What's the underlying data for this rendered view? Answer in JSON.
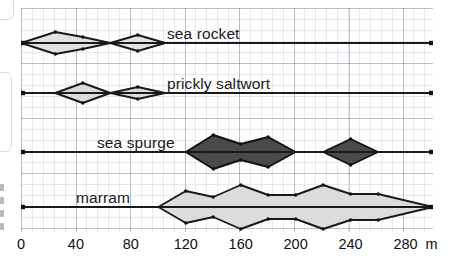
{
  "chart_data": {
    "type": "area",
    "chart_kind": "kite-diagram",
    "title": "",
    "xlabel": "m",
    "ylabel": "",
    "xlim": [
      0,
      300
    ],
    "grid": true,
    "legend": "inline-labels",
    "axis_unit": "m",
    "x_ticks": [
      {
        "value": 0,
        "label": "0"
      },
      {
        "value": 40,
        "label": "40"
      },
      {
        "value": 80,
        "label": "80"
      },
      {
        "value": 120,
        "label": "120"
      },
      {
        "value": 160,
        "label": "160"
      },
      {
        "value": 200,
        "label": "200"
      },
      {
        "value": 240,
        "label": "240"
      },
      {
        "value": 280,
        "label": "280"
      }
    ],
    "series": [
      {
        "name": "sea rocket",
        "label": "sea rocket",
        "fill": "#e2e2e2",
        "stroke": "#1a1a1a",
        "baseline_y": 43,
        "x": [
          0,
          25,
          45,
          65,
          85,
          105,
          300
        ],
        "half_width": [
          0,
          11,
          6,
          0,
          8,
          0,
          0
        ]
      },
      {
        "name": "prickly saltwort",
        "label": "prickly saltwort",
        "fill": "#dcdcdc",
        "stroke": "#1a1a1a",
        "baseline_y": 93,
        "x": [
          0,
          25,
          45,
          65,
          85,
          105,
          300
        ],
        "half_width": [
          0,
          0,
          10,
          0,
          6,
          0,
          0
        ]
      },
      {
        "name": "sea spurge",
        "label": "sea spurge",
        "fill": "#4a4a4a",
        "stroke": "#111111",
        "baseline_y": 152,
        "x": [
          0,
          120,
          140,
          160,
          180,
          200,
          220,
          240,
          260,
          300
        ],
        "half_width": [
          0,
          0,
          17,
          8,
          15,
          0,
          0,
          13,
          0,
          0
        ]
      },
      {
        "name": "marram",
        "label": "marram",
        "fill": "#dcdcdc",
        "stroke": "#1a1a1a",
        "baseline_y": 207,
        "x": [
          0,
          100,
          120,
          140,
          160,
          180,
          200,
          220,
          240,
          260,
          300
        ],
        "half_width": [
          0,
          0,
          16,
          10,
          22,
          12,
          12,
          22,
          13,
          13,
          0
        ]
      }
    ]
  },
  "axis": {
    "unit_label": "m"
  },
  "labels": {
    "sea_rocket": "sea rocket",
    "prickly_saltwort": "prickly saltwort",
    "sea_spurge": "sea spurge",
    "marram": "marram"
  }
}
